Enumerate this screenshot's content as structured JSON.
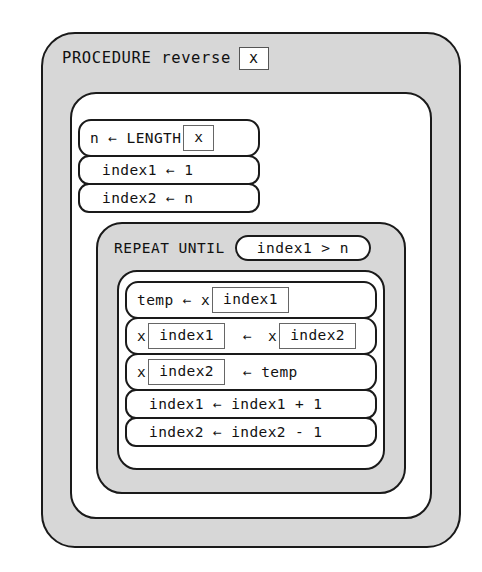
{
  "diagram": {
    "type": "nassi-shneiderman-pseudocode-block-diagram",
    "procedure": {
      "keyword": "PROCEDURE",
      "name": "reverse",
      "parameter": "x"
    },
    "setup_statements": [
      {
        "id": "n-length",
        "parts": [
          {
            "kind": "text",
            "value": "n"
          },
          {
            "kind": "text",
            "value": "←"
          },
          {
            "kind": "text",
            "value": "LENGTH"
          },
          {
            "kind": "box",
            "value": "x"
          }
        ]
      },
      {
        "id": "index1-init",
        "parts": [
          {
            "kind": "text",
            "value": "index1"
          },
          {
            "kind": "text",
            "value": "←"
          },
          {
            "kind": "text",
            "value": "1"
          }
        ]
      },
      {
        "id": "index2-init",
        "parts": [
          {
            "kind": "text",
            "value": "index2"
          },
          {
            "kind": "text",
            "value": "←"
          },
          {
            "kind": "text",
            "value": "n"
          }
        ]
      }
    ],
    "loop": {
      "keyword": "REPEAT UNTIL",
      "condition": "index1 > n",
      "body_statements": [
        {
          "id": "temp-assign",
          "parts": [
            {
              "kind": "text",
              "value": "temp"
            },
            {
              "kind": "text",
              "value": "←"
            },
            {
              "kind": "text",
              "value": "x"
            },
            {
              "kind": "box",
              "value": "index1"
            }
          ]
        },
        {
          "id": "swap-first",
          "parts": [
            {
              "kind": "text",
              "value": "x"
            },
            {
              "kind": "box",
              "value": "index1"
            },
            {
              "kind": "text",
              "value": "←"
            },
            {
              "kind": "text",
              "value": "x"
            },
            {
              "kind": "box",
              "value": "index2"
            }
          ]
        },
        {
          "id": "swap-second",
          "parts": [
            {
              "kind": "text",
              "value": "x"
            },
            {
              "kind": "box",
              "value": "index2"
            },
            {
              "kind": "text",
              "value": "←"
            },
            {
              "kind": "text",
              "value": "temp"
            }
          ]
        },
        {
          "id": "index1-increment",
          "parts": [
            {
              "kind": "text",
              "value": "index1"
            },
            {
              "kind": "text",
              "value": "←"
            },
            {
              "kind": "text",
              "value": "index1 + 1"
            }
          ]
        },
        {
          "id": "index2-decrement",
          "parts": [
            {
              "kind": "text",
              "value": "index2"
            },
            {
              "kind": "text",
              "value": "←"
            },
            {
              "kind": "text",
              "value": "index2 - 1"
            }
          ]
        }
      ]
    }
  },
  "colors": {
    "band_fill": "#d7d7d7",
    "body_fill": "#ffffff",
    "stroke": "#1a1a1a",
    "inner_box_stroke": "#666666",
    "text": "#111111",
    "page_background": "#ffffff"
  },
  "labels": {
    "procedure_header_text": "PROCEDURE reverse",
    "procedure_param": "x",
    "repeat_header_text": "REPEAT UNTIL",
    "repeat_condition": "index1 > n",
    "line_n_length": "n ← LENGTH",
    "line_n_length_box": "x",
    "line_index1_init": "index1 ← 1",
    "line_index2_init": "index2 ← n",
    "line_temp_lhs": "temp ← x",
    "line_temp_box": "index1",
    "line_swap1_a": "x",
    "line_swap1_box_a": "index1",
    "line_swap1_mid": "←",
    "line_swap1_b": "x",
    "line_swap1_box_b": "index2",
    "line_swap2_a": "x",
    "line_swap2_box_a": "index2",
    "line_swap2_rhs": "←  temp",
    "line_inc": "index1 ← index1 + 1",
    "line_dec": "index2 ← index2 - 1"
  }
}
